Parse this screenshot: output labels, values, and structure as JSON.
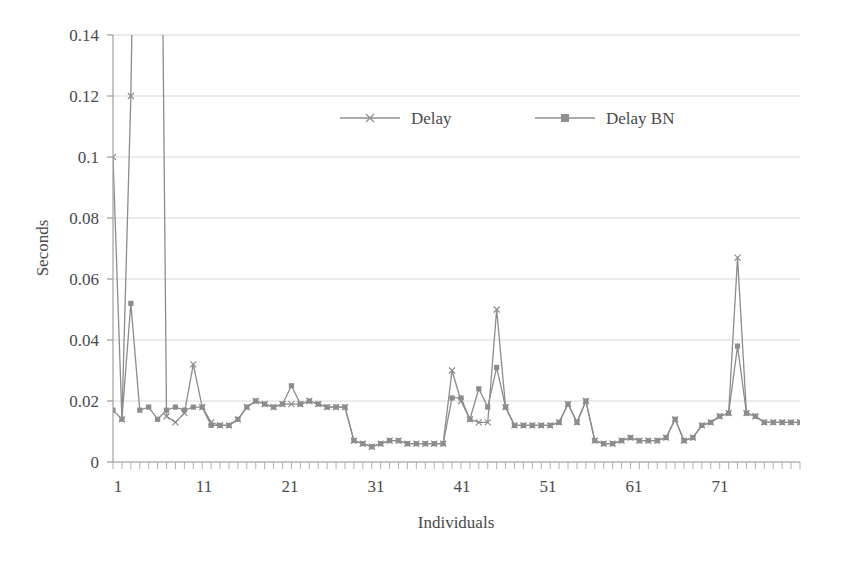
{
  "chart_data": {
    "type": "line",
    "title": "",
    "xlabel": "Individuals",
    "ylabel": "Seconds",
    "xlim": [
      1,
      78
    ],
    "ylim": [
      0,
      0.14
    ],
    "grid": true,
    "grid_axis": "y",
    "legend_position": "top-center-inside",
    "y_ticks": [
      "0",
      "0.02",
      "0.04",
      "0.06",
      "0.08",
      "0.1",
      "0.12",
      "0.14"
    ],
    "y_tick_values": [
      0,
      0.02,
      0.04,
      0.06,
      0.08,
      0.1,
      0.12,
      0.14
    ],
    "x_ticks": [
      "1",
      "11",
      "21",
      "31",
      "41",
      "51",
      "61",
      "71"
    ],
    "x_tick_values": [
      1,
      11,
      21,
      31,
      41,
      51,
      61,
      71
    ],
    "x_minor_tick_step": 1,
    "note": "Series values for indices 4, 5 and 6 of Delay exceed the plotted y-axis maximum of 0.14 and are clipped by the plot frame.",
    "series": [
      {
        "name": "Delay",
        "marker": "x",
        "color": "#8c8c8c",
        "values": [
          0.1,
          0.014,
          0.12,
          0.3,
          0.26,
          0.33,
          0.015,
          0.013,
          0.016,
          0.032,
          0.018,
          0.013,
          0.012,
          0.012,
          0.014,
          0.018,
          0.02,
          0.019,
          0.018,
          0.019,
          0.019,
          0.019,
          0.02,
          0.019,
          0.018,
          0.018,
          0.018,
          0.007,
          0.006,
          0.005,
          0.006,
          0.007,
          0.007,
          0.006,
          0.006,
          0.006,
          0.006,
          0.006,
          0.03,
          0.02,
          0.014,
          0.013,
          0.013,
          0.05,
          0.018,
          0.012,
          0.012,
          0.012,
          0.012,
          0.012,
          0.013,
          0.019,
          0.013,
          0.02,
          0.007,
          0.006,
          0.006,
          0.007,
          0.008,
          0.007,
          0.007,
          0.007,
          0.008,
          0.014,
          0.007,
          0.008,
          0.012,
          0.013,
          0.015,
          0.016,
          0.067,
          0.016,
          0.015,
          0.013,
          0.013,
          0.013,
          0.013,
          0.013
        ]
      },
      {
        "name": "Delay BN",
        "marker": "square",
        "color": "#8c8c8c",
        "values": [
          0.017,
          0.014,
          0.052,
          0.017,
          0.018,
          0.014,
          0.017,
          0.018,
          0.017,
          0.018,
          0.018,
          0.012,
          0.012,
          0.012,
          0.014,
          0.018,
          0.02,
          0.019,
          0.018,
          0.019,
          0.025,
          0.019,
          0.02,
          0.019,
          0.018,
          0.018,
          0.018,
          0.007,
          0.006,
          0.005,
          0.006,
          0.007,
          0.007,
          0.006,
          0.006,
          0.006,
          0.006,
          0.006,
          0.021,
          0.021,
          0.014,
          0.024,
          0.018,
          0.031,
          0.018,
          0.012,
          0.012,
          0.012,
          0.012,
          0.012,
          0.013,
          0.019,
          0.013,
          0.02,
          0.007,
          0.006,
          0.006,
          0.007,
          0.008,
          0.007,
          0.007,
          0.007,
          0.008,
          0.014,
          0.007,
          0.008,
          0.012,
          0.013,
          0.015,
          0.016,
          0.038,
          0.016,
          0.015,
          0.013,
          0.013,
          0.013,
          0.013,
          0.013
        ]
      }
    ],
    "legend": [
      {
        "label": "Delay",
        "marker": "x-marker-icon"
      },
      {
        "label": "Delay BN",
        "marker": "square-marker-icon"
      }
    ]
  },
  "colors": {
    "line": "#8f8f8f",
    "grid": "#d6d6d6",
    "axis": "#9a9a9a",
    "text": "#4a4a4a",
    "background": "#ffffff"
  }
}
